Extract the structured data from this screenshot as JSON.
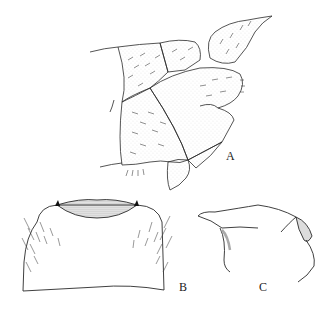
{
  "figure": {
    "panels": [
      {
        "id": "A",
        "label": "A",
        "description": "terminal abdominal segments, lateral view"
      },
      {
        "id": "B",
        "label": "B",
        "description": "plate, ventral/dorsal view with setae"
      },
      {
        "id": "C",
        "label": "C",
        "description": "process, lateral view"
      }
    ],
    "colors": {
      "ink": "#2a2a2a",
      "stipple": "#9a9a9a",
      "background": "#ffffff"
    }
  }
}
